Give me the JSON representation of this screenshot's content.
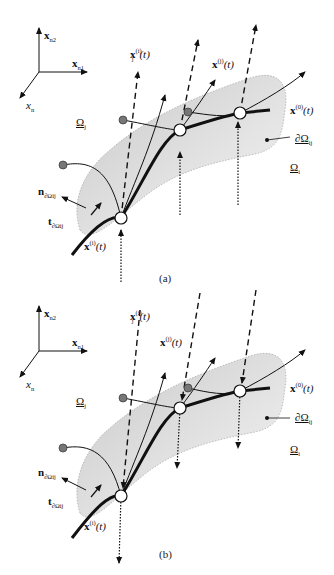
{
  "figure": {
    "panels": [
      {
        "id": "a",
        "caption": "(a)",
        "axes": {
          "x_n2": "x",
          "x_n2_sub": "n2",
          "x_n1": "x",
          "x_n1_sub": "n1",
          "x_n": "x",
          "x_n_sub": "n"
        },
        "labels": {
          "xj_i": "x",
          "xj_i_sub": "j",
          "xj_i_sup": "(i)",
          "xj_i_arg": "(t)",
          "x_j": "x",
          "x_j_sup": "(j)",
          "x_j_arg": "(t)",
          "x_0": "x",
          "x_0_sup": "(0)",
          "x_0_arg": "(t)",
          "omega_j": "Ω",
          "omega_j_sub": "j",
          "omega_i": "Ω",
          "omega_i_sub": "i",
          "boundary": "∂Ω",
          "boundary_sub": "ij",
          "normal": "n",
          "normal_sub": "∂Ωij",
          "tangent": "t",
          "tangent_sub": "∂Ωij",
          "x_i": "x",
          "x_i_sup": "(i)",
          "x_i_arg": "(t)"
        }
      },
      {
        "id": "b",
        "caption": "(b)",
        "axes": {
          "x_n2": "x",
          "x_n2_sub": "n2",
          "x_n1": "x",
          "x_n1_sub": "n1",
          "x_n": "x",
          "x_n_sub": "n"
        },
        "labels": {
          "xj_i": "x",
          "xj_i_sub": "j",
          "xj_i_sup": "(i)",
          "xj_i_arg": "(t)",
          "x_j": "x",
          "x_j_sup": "(j)",
          "x_j_arg": "(t)",
          "x_0": "x",
          "x_0_sup": "(0)",
          "x_0_arg": "(t)",
          "omega_j": "Ω",
          "omega_j_sub": "j",
          "omega_i": "Ω",
          "omega_i_sub": "i",
          "boundary": "∂Ω",
          "boundary_sub": "ij",
          "normal": "n",
          "normal_sub": "∂Ωij",
          "tangent": "t",
          "tangent_sub": "∂Ωij",
          "x_i": "x",
          "x_i_sup": "(i)",
          "x_i_arg": "(t)"
        }
      }
    ],
    "colors": {
      "region_fill": "#d9d9d9",
      "region_fill_light": "#eeeeee",
      "line": "#111111",
      "start_dot": "#777777"
    }
  }
}
